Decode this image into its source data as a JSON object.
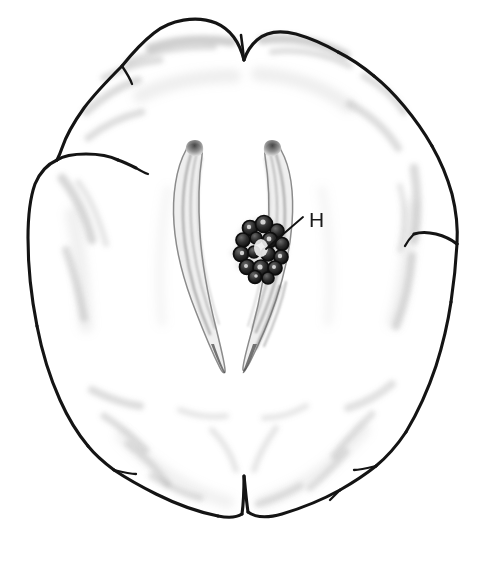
{
  "figure": {
    "kind": "anatomical-line-drawing",
    "view": "axial",
    "background_color": "#ffffff",
    "ink_color": "#111111",
    "shading_color": "#9a9a9a"
  },
  "labels": [
    {
      "id": "H",
      "text": "H",
      "target": "choroid-plexus-cluster",
      "label_x": 307,
      "label_y": 220,
      "leader_from_x": 303,
      "leader_from_y": 217,
      "leader_to_x": 266,
      "leader_to_y": 249
    }
  ],
  "structures": {
    "cortex_outline": "brain-outline",
    "ventricles": [
      "left-lateral-ventricle",
      "right-lateral-ventricle"
    ],
    "lesion": "choroid-plexus-cluster"
  }
}
